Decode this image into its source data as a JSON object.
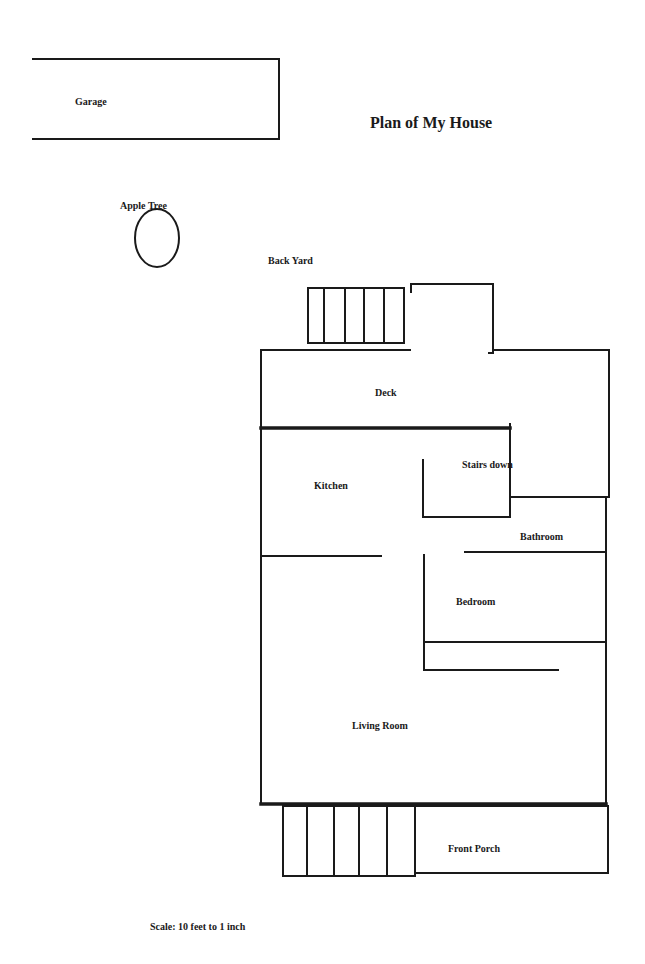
{
  "title": {
    "text": "Plan of My House",
    "x": 370,
    "y": 128,
    "size": 16
  },
  "scale": {
    "text": "Scale:  10 feet to 1 inch",
    "x": 150,
    "y": 930,
    "size": 10
  },
  "colors": {
    "ink": "#1a1a1a",
    "background": "#ffffff"
  },
  "labels": [
    {
      "id": "garage",
      "text": "Garage",
      "x": 75,
      "y": 105,
      "size": 10
    },
    {
      "id": "apple-tree",
      "text": "Apple Tree",
      "x": 120,
      "y": 209,
      "size": 10
    },
    {
      "id": "back-yard",
      "text": "Back Yard",
      "x": 268,
      "y": 264,
      "size": 10
    },
    {
      "id": "deck",
      "text": "Deck",
      "x": 375,
      "y": 396,
      "size": 10
    },
    {
      "id": "kitchen",
      "text": "Kitchen",
      "x": 314,
      "y": 489,
      "size": 10
    },
    {
      "id": "stairs-down",
      "text": "Stairs down",
      "x": 462,
      "y": 468,
      "size": 10
    },
    {
      "id": "bathroom",
      "text": "Bathroom",
      "x": 520,
      "y": 540,
      "size": 10
    },
    {
      "id": "bedroom",
      "text": "Bedroom",
      "x": 456,
      "y": 605,
      "size": 10
    },
    {
      "id": "living-room",
      "text": "Living Room",
      "x": 352,
      "y": 729,
      "size": 10
    },
    {
      "id": "front-porch",
      "text": "Front Porch",
      "x": 448,
      "y": 852,
      "size": 10
    }
  ],
  "apple_tree_shape": {
    "cx": 157,
    "cy": 238,
    "rx": 22,
    "ry": 29
  },
  "walls": [
    {
      "id": "garage-top",
      "x1": 33,
      "y1": 59,
      "x2": 279,
      "y2": 59,
      "thick": false
    },
    {
      "id": "garage-right",
      "x1": 279,
      "y1": 59,
      "x2": 279,
      "y2": 139,
      "thick": false
    },
    {
      "id": "garage-bottom",
      "x1": 33,
      "y1": 139,
      "x2": 279,
      "y2": 139,
      "thick": false
    },
    {
      "id": "back-steps-outline-top",
      "x1": 308,
      "y1": 288,
      "x2": 404,
      "y2": 288,
      "thick": false
    },
    {
      "id": "back-steps-outline-bottom",
      "x1": 308,
      "y1": 343,
      "x2": 404,
      "y2": 343,
      "thick": false
    },
    {
      "id": "back-step-1",
      "x1": 308,
      "y1": 288,
      "x2": 308,
      "y2": 343,
      "thick": false
    },
    {
      "id": "back-step-2",
      "x1": 324,
      "y1": 288,
      "x2": 324,
      "y2": 343,
      "thick": false
    },
    {
      "id": "back-step-3",
      "x1": 345,
      "y1": 288,
      "x2": 345,
      "y2": 343,
      "thick": false
    },
    {
      "id": "back-step-4",
      "x1": 364,
      "y1": 288,
      "x2": 364,
      "y2": 343,
      "thick": false
    },
    {
      "id": "back-step-5",
      "x1": 384,
      "y1": 288,
      "x2": 384,
      "y2": 343,
      "thick": false
    },
    {
      "id": "back-step-6",
      "x1": 404,
      "y1": 288,
      "x2": 404,
      "y2": 343,
      "thick": false
    },
    {
      "id": "entry-top",
      "x1": 411,
      "y1": 284,
      "x2": 493,
      "y2": 284,
      "thick": false
    },
    {
      "id": "entry-left-stub",
      "x1": 411,
      "y1": 284,
      "x2": 411,
      "y2": 292,
      "thick": false
    },
    {
      "id": "entry-right",
      "x1": 493,
      "y1": 284,
      "x2": 493,
      "y2": 353,
      "thick": false
    },
    {
      "id": "entry-right-foot",
      "x1": 489,
      "y1": 353,
      "x2": 493,
      "y2": 353,
      "thick": false
    },
    {
      "id": "deck-top-left",
      "x1": 261,
      "y1": 350,
      "x2": 410,
      "y2": 350,
      "thick": false
    },
    {
      "id": "deck-top-right",
      "x1": 493,
      "y1": 350,
      "x2": 609,
      "y2": 350,
      "thick": false
    },
    {
      "id": "house-left",
      "x1": 261,
      "y1": 350,
      "x2": 261,
      "y2": 804,
      "thick": false
    },
    {
      "id": "deck-right",
      "x1": 609,
      "y1": 350,
      "x2": 609,
      "y2": 497,
      "thick": false
    },
    {
      "id": "deck-bottom",
      "x1": 261,
      "y1": 428,
      "x2": 510,
      "y2": 428,
      "thick": true
    },
    {
      "id": "stairs-right",
      "x1": 510,
      "y1": 424,
      "x2": 510,
      "y2": 517,
      "thick": false
    },
    {
      "id": "stairs-left",
      "x1": 423,
      "y1": 460,
      "x2": 423,
      "y2": 517,
      "thick": false
    },
    {
      "id": "stairs-bottom",
      "x1": 423,
      "y1": 517,
      "x2": 510,
      "y2": 517,
      "thick": false
    },
    {
      "id": "bath-top",
      "x1": 510,
      "y1": 497,
      "x2": 609,
      "y2": 497,
      "thick": false
    },
    {
      "id": "house-right-lower",
      "x1": 606,
      "y1": 497,
      "x2": 606,
      "y2": 804,
      "thick": false
    },
    {
      "id": "kitchen-bottom",
      "x1": 261,
      "y1": 556,
      "x2": 381,
      "y2": 556,
      "thick": false
    },
    {
      "id": "bath-bottom",
      "x1": 465,
      "y1": 552,
      "x2": 604,
      "y2": 552,
      "thick": false
    },
    {
      "id": "bedroom-left",
      "x1": 424,
      "y1": 555,
      "x2": 424,
      "y2": 670,
      "thick": false
    },
    {
      "id": "bedroom-bottom",
      "x1": 424,
      "y1": 642,
      "x2": 606,
      "y2": 642,
      "thick": false
    },
    {
      "id": "closet-bottom",
      "x1": 424,
      "y1": 670,
      "x2": 558,
      "y2": 670,
      "thick": false
    },
    {
      "id": "living-bottom",
      "x1": 261,
      "y1": 804,
      "x2": 606,
      "y2": 804,
      "thick": true
    },
    {
      "id": "porch-top",
      "x1": 283,
      "y1": 806,
      "x2": 608,
      "y2": 806,
      "thick": false
    },
    {
      "id": "porch-right",
      "x1": 608,
      "y1": 806,
      "x2": 608,
      "y2": 873,
      "thick": false
    },
    {
      "id": "porch-bottom",
      "x1": 415,
      "y1": 873,
      "x2": 608,
      "y2": 873,
      "thick": false
    },
    {
      "id": "front-steps-bottom",
      "x1": 283,
      "y1": 876,
      "x2": 415,
      "y2": 876,
      "thick": false
    },
    {
      "id": "front-step-1",
      "x1": 283,
      "y1": 806,
      "x2": 283,
      "y2": 876,
      "thick": false
    },
    {
      "id": "front-step-2",
      "x1": 307,
      "y1": 806,
      "x2": 307,
      "y2": 876,
      "thick": false
    },
    {
      "id": "front-step-3",
      "x1": 334,
      "y1": 806,
      "x2": 334,
      "y2": 876,
      "thick": false
    },
    {
      "id": "front-step-4",
      "x1": 359,
      "y1": 806,
      "x2": 359,
      "y2": 876,
      "thick": false
    },
    {
      "id": "front-step-5",
      "x1": 387,
      "y1": 806,
      "x2": 387,
      "y2": 876,
      "thick": false
    },
    {
      "id": "front-step-6",
      "x1": 415,
      "y1": 806,
      "x2": 415,
      "y2": 876,
      "thick": false
    }
  ]
}
